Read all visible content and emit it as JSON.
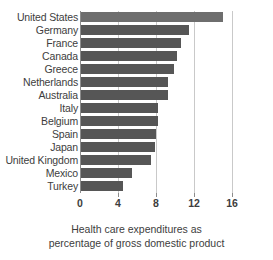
{
  "chart_data": {
    "type": "bar",
    "orientation": "horizontal",
    "title": "",
    "xlabel": "Health care expenditures as percentage of gross domestic product",
    "ylabel": "",
    "xlim": [
      0,
      16
    ],
    "xticks": [
      0,
      4,
      8,
      12,
      16
    ],
    "xtick_labels": [
      "0",
      "4",
      "8",
      "12",
      "16"
    ],
    "grid": true,
    "grid_axis": "x",
    "legend": "none",
    "categories": [
      "United States",
      "Germany",
      "France",
      "Canada",
      "Greece",
      "Netherlands",
      "Australia",
      "Italy",
      "Belgium",
      "Spain",
      "Japan",
      "United Kingdom",
      "Mexico",
      "Turkey"
    ],
    "values": [
      14.9,
      11.4,
      10.5,
      10.1,
      9.8,
      9.2,
      9.2,
      8.1,
      8.1,
      7.9,
      7.8,
      7.4,
      5.4,
      4.4
    ],
    "bar_color": "#565656",
    "highlight_color": "#6e6e6e",
    "highlight_index": 0,
    "axis_color": "#8c8c8c",
    "gridline_color": "#c9c9c9"
  },
  "caption": {
    "line1": "Health care expenditures as",
    "line2": "percentage of gross domestic product"
  }
}
